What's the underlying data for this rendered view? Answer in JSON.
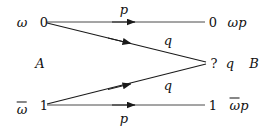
{
  "figure": {
    "line_color": "#1a1a1a",
    "text_color": "#111111",
    "background": "#ffffff"
  },
  "left": {
    "top_prior": "ω",
    "top_state": "0",
    "bottom_prior": "ω",
    "bottom_prior_has_bar": true,
    "bottom_state": "1",
    "group_label": "A"
  },
  "right": {
    "top_state": "0",
    "top_output": "ωp",
    "top_output_has_bar": false,
    "middle_state": "?",
    "middle_output": "q",
    "group_label": "B",
    "bottom_state": "1",
    "bottom_output": "ωp",
    "bottom_output_has_bar": true
  },
  "edges": [
    {
      "name": "edge-0-to-0",
      "from": "0",
      "to": "0",
      "label": "p",
      "label_pos": "above"
    },
    {
      "name": "edge-0-to-erasure",
      "from": "0",
      "to": "?",
      "label": "q",
      "label_pos": "above"
    },
    {
      "name": "edge-1-to-erasure",
      "from": "1",
      "to": "?",
      "label": "q",
      "label_pos": "below"
    },
    {
      "name": "edge-1-to-1",
      "from": "1",
      "to": "1",
      "label": "p",
      "label_pos": "below"
    }
  ],
  "geometry": {
    "src_top": {
      "x": 44,
      "y": 22
    },
    "src_bottom": {
      "x": 44,
      "y": 105
    },
    "dst_top": {
      "x": 208,
      "y": 22
    },
    "dst_mid": {
      "x": 209,
      "y": 63
    },
    "dst_bottom": {
      "x": 208,
      "y": 105
    }
  }
}
